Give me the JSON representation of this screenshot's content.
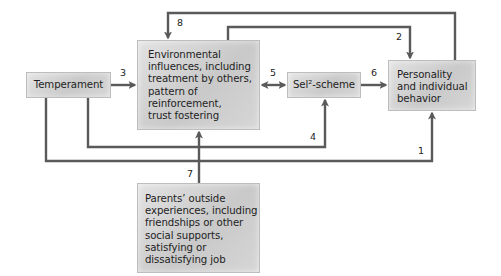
{
  "nodes": {
    "temperament": {
      "label": "Temperament"
    },
    "environment": {
      "label": "Environmental\ninfluences, including\ntreatment by others,\npattern of\nreinforcement,\ntrust fostering"
    },
    "self_scheme": {
      "label": "Sel²-scheme"
    },
    "personality": {
      "label": "Personality\nand individual\nbehavior"
    },
    "parents": {
      "label": "Parents’ outside\nexperiences, including\nfriendships or other\nsocial supports,\nsatisfying or\ndissatisfying job"
    }
  },
  "edges": [
    {
      "id": "1",
      "label": "1",
      "from": "temperament",
      "to": "personality"
    },
    {
      "id": "2",
      "label": "2",
      "from": "environment",
      "to": "personality"
    },
    {
      "id": "3",
      "label": "3",
      "from": "temperament",
      "to": "environment"
    },
    {
      "id": "4",
      "label": "4",
      "from": "temperament",
      "to": "self_scheme"
    },
    {
      "id": "5",
      "label": "5",
      "from": "environment",
      "to": "self_scheme",
      "bidirectional": true
    },
    {
      "id": "6",
      "label": "6",
      "from": "self_scheme",
      "to": "personality"
    },
    {
      "id": "7",
      "label": "7",
      "from": "parents",
      "to": "environment"
    },
    {
      "id": "8",
      "label": "8",
      "from": "personality",
      "to": "environment"
    }
  ],
  "colors": {
    "arrow": "#5a5a5a",
    "box_fill": "#d0d0d0",
    "text": "#1e1e1e"
  }
}
